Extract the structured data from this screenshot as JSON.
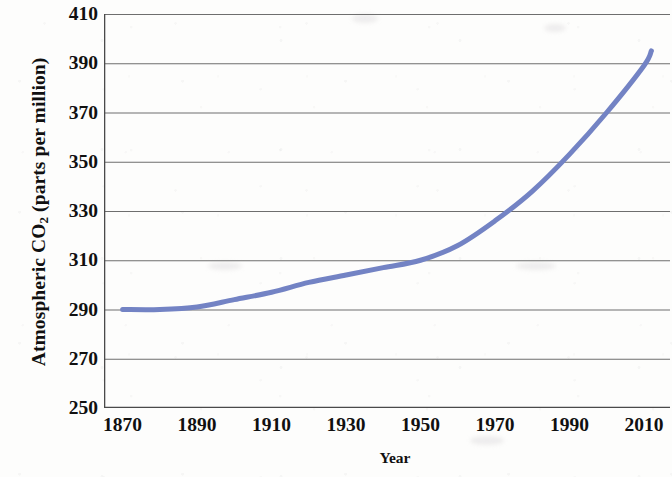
{
  "figure": {
    "background_color": "#fdfdfc",
    "axis_color": "#4a4a4a",
    "grid_color": "#6e6e6e",
    "label_color": "#101010"
  },
  "chart_data": {
    "type": "line",
    "title": "",
    "xlabel": "Year",
    "ylabel": "Atmospheric CO2 (parts per million)",
    "ylabel_parts": {
      "before": "Atmospheric CO",
      "subscript": "2",
      "after": " (parts per million)"
    },
    "xlim": [
      1865,
      2017
    ],
    "ylim": [
      250,
      410
    ],
    "xticks": [
      1870,
      1890,
      1910,
      1930,
      1950,
      1970,
      1990,
      2010
    ],
    "xtick_labels": [
      "1870",
      "1890",
      "1910",
      "1930",
      "1950",
      "1970",
      "1990",
      "2010"
    ],
    "yticks": [
      250,
      270,
      290,
      310,
      330,
      350,
      370,
      390,
      410
    ],
    "ytick_labels": [
      "250",
      "270",
      "290",
      "310",
      "330",
      "350",
      "370",
      "390",
      "410"
    ],
    "grid": "horizontal",
    "legend": "none",
    "series": [
      {
        "name": "Atmospheric CO2",
        "color": "#7383c4",
        "line_width": 5,
        "x": [
          1870,
          1880,
          1890,
          1900,
          1910,
          1920,
          1930,
          1940,
          1950,
          1960,
          1970,
          1980,
          1990,
          2000,
          2010,
          2012
        ],
        "values": [
          290,
          290,
          291,
          294,
          297,
          301,
          304,
          307,
          310,
          316,
          326,
          338,
          353,
          370,
          389,
          395
        ]
      }
    ],
    "annotations": []
  }
}
